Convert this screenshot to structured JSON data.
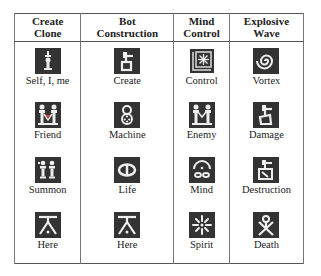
{
  "table": {
    "headers": [
      {
        "line1": "Create",
        "line2": "Clone"
      },
      {
        "line1": "Bot",
        "line2": "Construction"
      },
      {
        "line1": "Mind",
        "line2": "Control"
      },
      {
        "line1": "Explosive",
        "line2": "Wave"
      }
    ],
    "rows": [
      [
        {
          "label": "Self, I, me",
          "icon": "self-icon"
        },
        {
          "label": "Create",
          "icon": "create-icon"
        },
        {
          "label": "Control",
          "icon": "control-icon"
        },
        {
          "label": "Vortex",
          "icon": "vortex-icon"
        }
      ],
      [
        {
          "label": "Friend",
          "icon": "friend-icon"
        },
        {
          "label": "Machine",
          "icon": "machine-icon"
        },
        {
          "label": "Enemy",
          "icon": "enemy-icon"
        },
        {
          "label": "Damage",
          "icon": "damage-icon"
        }
      ],
      [
        {
          "label": "Summon",
          "icon": "summon-icon"
        },
        {
          "label": "Life",
          "icon": "life-icon"
        },
        {
          "label": "Mind",
          "icon": "mind-icon"
        },
        {
          "label": "Destruction",
          "icon": "destruction-icon"
        }
      ],
      [
        {
          "label": "Here",
          "icon": "here-icon"
        },
        {
          "label": "Here",
          "icon": "here-icon"
        },
        {
          "label": "Spirit",
          "icon": "spirit-icon"
        },
        {
          "label": "Death",
          "icon": "death-icon"
        }
      ]
    ]
  }
}
